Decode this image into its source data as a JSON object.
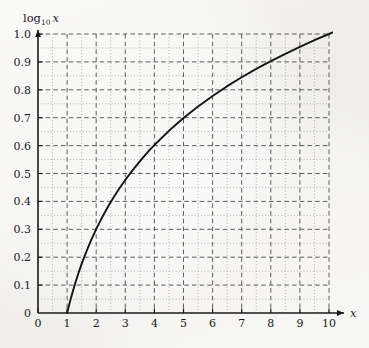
{
  "figure": {
    "background_color": "#f1f0ee",
    "ink_color": "#1b1b1b",
    "grid_major_color": "#545454",
    "grid_minor_color": "#9a9a9a"
  },
  "labels": {
    "y_axis_label_main": "log",
    "y_axis_label_sub": "10",
    "y_axis_label_var": "x",
    "x_axis_label": "x"
  },
  "chart_data": {
    "type": "line",
    "title": "",
    "subtitle": "",
    "xlabel": "x",
    "ylabel": "log10 x",
    "xlim": [
      0,
      10
    ],
    "ylim": [
      0,
      1.0
    ],
    "grid": true,
    "grid_major_step_x": 1,
    "grid_major_step_y": 0.1,
    "grid_minor_step_x": 0.5,
    "grid_minor_step_y": 0.05,
    "legend": null,
    "legend_position": "none",
    "x_tick_labels": [
      "0",
      "1",
      "2",
      "3",
      "4",
      "5",
      "6",
      "7",
      "8",
      "9",
      "10"
    ],
    "x_tick_values": [
      0,
      1,
      2,
      3,
      4,
      5,
      6,
      7,
      8,
      9,
      10
    ],
    "y_tick_labels": [
      "0",
      "0.1",
      "0.2",
      "0.3",
      "0.4",
      "0.5",
      "0.6",
      "0.7",
      "0.8",
      "0.9",
      "1.0"
    ],
    "y_tick_values": [
      0,
      0.1,
      0.2,
      0.3,
      0.4,
      0.5,
      0.6,
      0.7,
      0.8,
      0.9,
      1.0
    ],
    "series": [
      {
        "name": "log10 x",
        "x": [
          1.0,
          1.1,
          1.2,
          1.3,
          1.4,
          1.5,
          1.6,
          1.8,
          2.0,
          2.2,
          2.4,
          2.6,
          2.8,
          3.0,
          3.2,
          3.4,
          3.6,
          3.8,
          4.0,
          4.5,
          5.0,
          5.5,
          6.0,
          6.5,
          7.0,
          7.5,
          8.0,
          8.5,
          9.0,
          9.5,
          10.0,
          10.2
        ],
        "y": [
          0.0,
          0.041,
          0.079,
          0.114,
          0.146,
          0.176,
          0.204,
          0.255,
          0.301,
          0.342,
          0.38,
          0.415,
          0.447,
          0.477,
          0.505,
          0.531,
          0.556,
          0.58,
          0.602,
          0.653,
          0.699,
          0.74,
          0.778,
          0.813,
          0.845,
          0.875,
          0.903,
          0.929,
          0.954,
          0.978,
          1.0,
          1.009
        ]
      }
    ]
  }
}
